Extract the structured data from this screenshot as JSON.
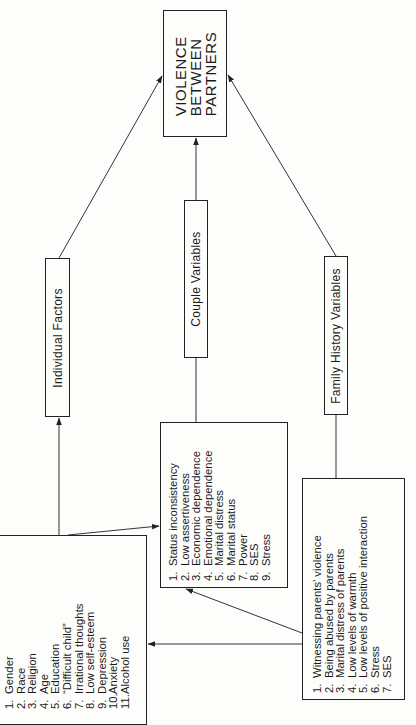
{
  "diagram": {
    "outcome": {
      "lines": [
        "VIOLENCE",
        "BETWEEN",
        "PARTNERS"
      ]
    },
    "categories": {
      "individual": "Individual Factors",
      "couple": "Couple Variables",
      "family": "Family History Variables"
    },
    "lists": {
      "individual": [
        {
          "num": "1.",
          "text": "Gender"
        },
        {
          "num": "2.",
          "text": "Race"
        },
        {
          "num": "3.",
          "text": "Religion"
        },
        {
          "num": "4.",
          "text": "Age"
        },
        {
          "num": "5.",
          "text": "Education"
        },
        {
          "num": "6.",
          "text": "“Difficult child”"
        },
        {
          "num": "7.",
          "text": "Irrational thoughts"
        },
        {
          "num": "8.",
          "text": "Low self-esteem"
        },
        {
          "num": "9.",
          "text": "Depression"
        },
        {
          "num": "10.",
          "text": "Anxiety"
        },
        {
          "num": "11.",
          "text": "Alcohol use"
        }
      ],
      "couple": [
        {
          "num": "1.",
          "text": "Status inconsistency"
        },
        {
          "num": "2.",
          "text": "Low assertiveness"
        },
        {
          "num": "3.",
          "text": "Economic dependence"
        },
        {
          "num": "4.",
          "text": "Emotional dependence"
        },
        {
          "num": "5.",
          "text": "Marital distress"
        },
        {
          "num": "6.",
          "text": "Marital status"
        },
        {
          "num": "7.",
          "text": "Power"
        },
        {
          "num": "8.",
          "text": "SES"
        },
        {
          "num": "9.",
          "text": "Stress"
        }
      ],
      "family": [
        {
          "num": "1.",
          "text": "Witnessing parents’ violence"
        },
        {
          "num": "2.",
          "text": "Being abused by parents"
        },
        {
          "num": "3.",
          "text": "Marital distress of parents"
        },
        {
          "num": "4.",
          "text": "Low levels of warmth"
        },
        {
          "num": "5.",
          "text": "Low levels of positive interaction"
        },
        {
          "num": "6.",
          "text": "Stress"
        },
        {
          "num": "7.",
          "text": "SES"
        }
      ]
    },
    "colors": {
      "ink": "#222222",
      "paper": "#fdfdfc"
    }
  }
}
